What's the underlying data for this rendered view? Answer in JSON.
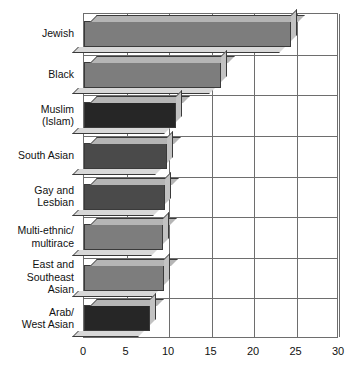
{
  "chart_data": {
    "type": "bar",
    "orientation": "horizontal",
    "title": "",
    "subtitle": "",
    "xlabel": "",
    "ylabel": "",
    "xlim": [
      0,
      30
    ],
    "ylim": null,
    "xticks": [
      "0",
      "5",
      "10",
      "15",
      "20",
      "25",
      "30"
    ],
    "xtick_values": [
      0,
      5,
      10,
      15,
      20,
      25,
      30
    ],
    "grid": "vertical-and-horizontal",
    "legend": "none",
    "categories": [
      "Jewish",
      "Black",
      "Muslim\n(Islam)",
      "South Asian",
      "Gay and\nLesbian",
      "Multi-ethnic/\nmultirace",
      "East and\nSoutheast\nAsian",
      "Arab/\nWest Asian"
    ],
    "values": [
      24.3,
      16.1,
      10.8,
      9.8,
      9.5,
      9.3,
      9.4,
      7.8
    ],
    "bar_fills": [
      "#7d7d7d",
      "#7d7d7d",
      "#262626",
      "#4a4a4a",
      "#4a4a4a",
      "#7d7d7d",
      "#7d7d7d",
      "#262626"
    ],
    "bar_top_face": "#b5b5b5",
    "bar_side_face": "#c2c2c2",
    "bar_outline": "#3a3a3a",
    "gridline_color": "#6e6e6e",
    "background": "#ffffff",
    "text_color": "#111111"
  }
}
